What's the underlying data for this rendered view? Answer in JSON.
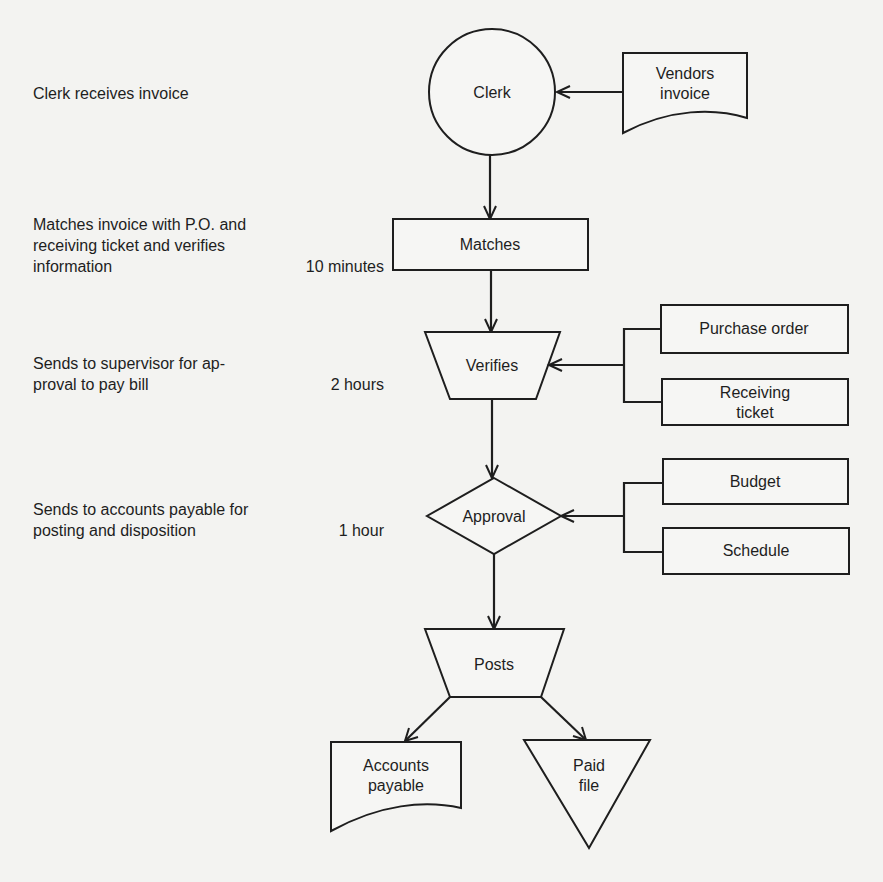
{
  "steps": [
    {
      "description": "Clerk receives invoice",
      "duration": ""
    },
    {
      "description": "Matches invoice with P.O. and\nreceiving ticket and verifies\ninformation",
      "duration": "10 minutes"
    },
    {
      "description": "Sends to supervisor for ap-\nproval to pay bill",
      "duration": "2 hours"
    },
    {
      "description": "Sends to accounts payable for\nposting and disposition",
      "duration": "1 hour"
    }
  ],
  "nodes": {
    "clerk": {
      "label": "Clerk",
      "shape": "circle"
    },
    "vendors_invoice": {
      "line1": "Vendors",
      "line2": "invoice",
      "shape": "document"
    },
    "matches": {
      "label": "Matches",
      "shape": "rectangle"
    },
    "verifies": {
      "label": "Verifies",
      "shape": "trapezoid"
    },
    "purchase_order": {
      "label": "Purchase order",
      "shape": "rectangle"
    },
    "receiving_ticket": {
      "line1": "Receiving",
      "line2": "ticket",
      "shape": "rectangle"
    },
    "approval": {
      "label": "Approval",
      "shape": "diamond"
    },
    "budget": {
      "label": "Budget",
      "shape": "rectangle"
    },
    "schedule": {
      "label": "Schedule",
      "shape": "rectangle"
    },
    "posts": {
      "label": "Posts",
      "shape": "trapezoid"
    },
    "accounts_payable": {
      "line1": "Accounts",
      "line2": "payable",
      "shape": "document"
    },
    "paid_file": {
      "line1": "Paid",
      "line2": "file",
      "shape": "inverted-triangle"
    }
  },
  "edges": [
    {
      "from": "vendors_invoice",
      "to": "clerk"
    },
    {
      "from": "clerk",
      "to": "matches"
    },
    {
      "from": "matches",
      "to": "verifies"
    },
    {
      "from": "purchase_order",
      "to": "verifies"
    },
    {
      "from": "receiving_ticket",
      "to": "verifies"
    },
    {
      "from": "verifies",
      "to": "approval"
    },
    {
      "from": "budget",
      "to": "approval"
    },
    {
      "from": "schedule",
      "to": "approval"
    },
    {
      "from": "approval",
      "to": "posts"
    },
    {
      "from": "posts",
      "to": "accounts_payable"
    },
    {
      "from": "posts",
      "to": "paid_file"
    }
  ],
  "colors": {
    "background": "#f3f3f1",
    "stroke": "#1e1e1e",
    "text": "#1e1e1e"
  }
}
